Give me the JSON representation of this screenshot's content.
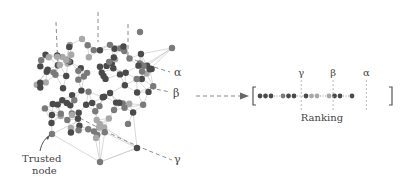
{
  "network": {
    "trusted_label_line1": "Trusted",
    "trusted_label_line2": "node",
    "alpha_label": "α",
    "beta_label": "β",
    "gamma_label": "γ",
    "node_colors": {
      "dark": "#4a4a4a",
      "mid": "#7a7a7a",
      "light": "#a8a8a8"
    },
    "edge_color": "#cfcfcf",
    "cut_line_color": "#8a8a8a"
  },
  "ranking": {
    "title": "Ranking",
    "markers": [
      {
        "symbol": "γ",
        "position": 0.34
      },
      {
        "symbol": "β",
        "position": 0.58
      },
      {
        "symbol": "α",
        "position": 0.83
      }
    ],
    "groups": [
      {
        "dots": [
          "dark",
          "dark",
          "dark"
        ]
      },
      {
        "dots": [
          "mid",
          "dark",
          "dark"
        ]
      },
      {
        "dots": [
          "dark",
          "light",
          "light"
        ]
      },
      {
        "dots": [
          "light",
          "dark",
          "dark"
        ]
      },
      {
        "dots": [
          "dark"
        ]
      }
    ]
  }
}
